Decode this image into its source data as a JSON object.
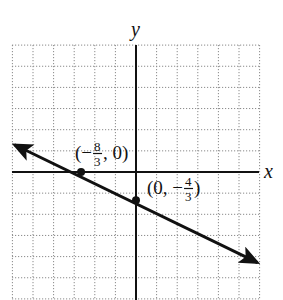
{
  "chart_data": {
    "type": "line",
    "title": "",
    "xlabel": "x",
    "ylabel": "y",
    "xlim": [
      -6,
      6
    ],
    "ylim": [
      -6,
      6
    ],
    "grid": true,
    "grid_style": "dotted",
    "grid_step": 1,
    "legend": null,
    "series": [
      {
        "name": "line",
        "equation": "y = -x/2 - 4/3",
        "slope": -0.5,
        "intercept": -1.3333,
        "x": [
          -6,
          5.9
        ],
        "y": [
          1.6667,
          -4.2833
        ],
        "arrows": "both",
        "color": "#111111"
      }
    ],
    "points": [
      {
        "x": -2.6667,
        "y": 0,
        "label": {
          "open": "(−",
          "num": "8",
          "den": "3",
          "close": ", 0)"
        }
      },
      {
        "x": 0,
        "y": -1.3333,
        "label": {
          "open": "(0, −",
          "num": "4",
          "den": "3",
          "close": ")"
        }
      }
    ],
    "annotations": [
      "(−8/3, 0)",
      "(0, −4/3)"
    ]
  },
  "axes": {
    "x_label": "x",
    "y_label": "y"
  },
  "labels": {
    "x_intercept": {
      "open": "(−",
      "num": "8",
      "den": "3",
      "close": ", 0)"
    },
    "y_intercept": {
      "open": "(0, −",
      "num": "4",
      "den": "3",
      "close": ")"
    }
  },
  "colors": {
    "line": "#111111",
    "axes": "#111111",
    "grid": "#8a8a8a",
    "background": "#ffffff"
  }
}
